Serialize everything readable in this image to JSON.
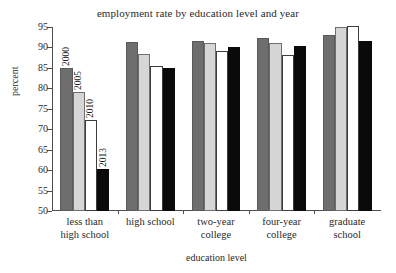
{
  "chart_data": {
    "type": "bar",
    "title": "employment rate by education level and year",
    "xlabel": "education level",
    "ylabel": "percent",
    "ylim": [
      50,
      95
    ],
    "yticks": [
      50,
      55,
      60,
      65,
      70,
      75,
      80,
      85,
      90,
      95
    ],
    "grid": false,
    "legend_position": "none",
    "categories": [
      "less than high school",
      "high school",
      "two-year college",
      "four-year college",
      "graduate school"
    ],
    "category_lines": [
      [
        "less than",
        "high school"
      ],
      [
        "high school"
      ],
      [
        "two-year",
        "college"
      ],
      [
        "four-year",
        "college"
      ],
      [
        "graduate",
        "school"
      ]
    ],
    "series": [
      {
        "name": "2000",
        "color": "#6e6e6e",
        "values": [
          85.0,
          91.3,
          91.7,
          92.3,
          93.1
        ]
      },
      {
        "name": "2005",
        "color": "#d6d6d6",
        "values": [
          79.0,
          88.5,
          91.2,
          91.0,
          95.0
        ]
      },
      {
        "name": "2010",
        "color": "#ffffff",
        "values": [
          72.3,
          85.5,
          89.2,
          88.2,
          95.2
        ]
      },
      {
        "name": "2013",
        "color": "#0a0a0a",
        "values": [
          60.3,
          85.0,
          90.2,
          90.4,
          91.5
        ]
      }
    ],
    "annotations": [
      {
        "text": "2000",
        "series": "2000",
        "category": "less than high school"
      },
      {
        "text": "2005",
        "series": "2005",
        "category": "less than high school"
      },
      {
        "text": "2010",
        "series": "2010",
        "category": "less than high school"
      },
      {
        "text": "2013",
        "series": "2013",
        "category": "less than high school"
      }
    ]
  }
}
